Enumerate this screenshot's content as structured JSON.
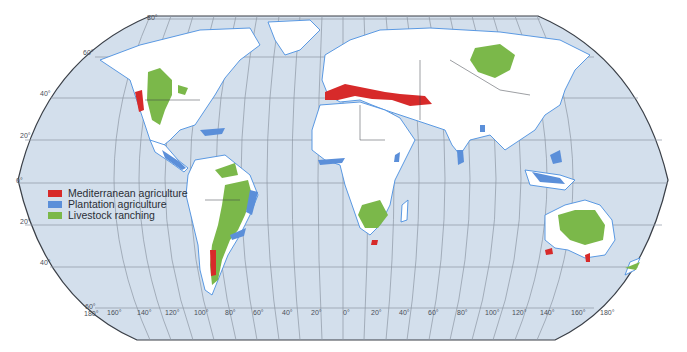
{
  "map": {
    "projection": "Robinson",
    "colors": {
      "ocean": "#d3dfec",
      "land": "#ffffff",
      "coast": "#4a8fe0",
      "graticule": "#8d97a3",
      "border": "#3a3f47",
      "mediterranean": "#d72a2a",
      "plantation": "#5b8fd9",
      "livestock": "#7bb84a"
    },
    "latitude_labels": [
      {
        "text": "80°",
        "x": 147,
        "y": 18
      },
      {
        "text": "60°",
        "x": 83,
        "y": 53
      },
      {
        "text": "40°",
        "x": 40,
        "y": 94
      },
      {
        "text": "20°",
        "x": 20,
        "y": 136
      },
      {
        "text": "0°",
        "x": 16,
        "y": 181
      },
      {
        "text": "20°",
        "x": 20,
        "y": 222
      },
      {
        "text": "40°",
        "x": 40,
        "y": 263
      },
      {
        "text": "60°",
        "x": 85,
        "y": 305
      }
    ],
    "longitude_labels": [
      {
        "text": "180°",
        "x": 84,
        "y": 312
      },
      {
        "text": "160°",
        "x": 107,
        "y": 311
      },
      {
        "text": "140°",
        "x": 137,
        "y": 311
      },
      {
        "text": "120°",
        "x": 165,
        "y": 311
      },
      {
        "text": "100°",
        "x": 194,
        "y": 311
      },
      {
        "text": "80°",
        "x": 225,
        "y": 311
      },
      {
        "text": "60°",
        "x": 253,
        "y": 311
      },
      {
        "text": "40°",
        "x": 282,
        "y": 311
      },
      {
        "text": "20°",
        "x": 311,
        "y": 311
      },
      {
        "text": "0°",
        "x": 343,
        "y": 311
      },
      {
        "text": "20°",
        "x": 371,
        "y": 311
      },
      {
        "text": "40°",
        "x": 399,
        "y": 311
      },
      {
        "text": "60°",
        "x": 428,
        "y": 311
      },
      {
        "text": "80°",
        "x": 457,
        "y": 311
      },
      {
        "text": "100°",
        "x": 485,
        "y": 311
      },
      {
        "text": "120°",
        "x": 512,
        "y": 311
      },
      {
        "text": "140°",
        "x": 540,
        "y": 311
      },
      {
        "text": "160°",
        "x": 571,
        "y": 311
      },
      {
        "text": "180°",
        "x": 600,
        "y": 311
      }
    ]
  },
  "legend": {
    "items": [
      {
        "label": "Mediterranean agriculture",
        "color": "#d72a2a"
      },
      {
        "label": "Plantation agriculture",
        "color": "#5b8fd9"
      },
      {
        "label": "Livestock ranching",
        "color": "#7bb84a"
      }
    ]
  }
}
